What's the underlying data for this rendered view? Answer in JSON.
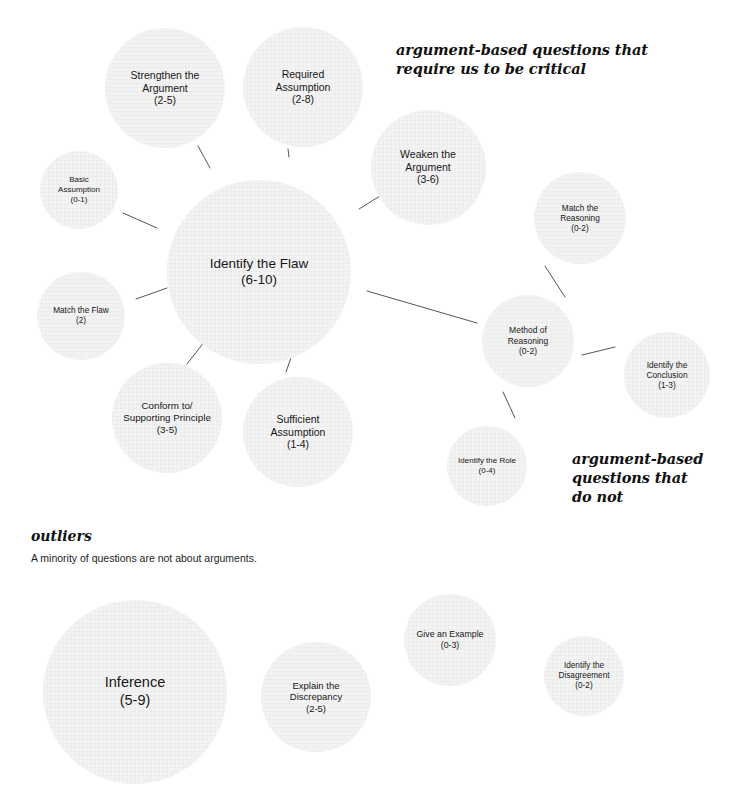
{
  "diagram": {
    "title_hidden": "",
    "colors": {
      "bubble_fill": "#f3f3f3",
      "text": "#171717",
      "line": "#555555",
      "background": "#ffffff"
    },
    "annotations": {
      "critical": "argument-based questions that\nrequire us to be critical",
      "do_not": "argument-based\nquestions that\ndo not"
    },
    "outliers": {
      "heading": "outliers",
      "subtitle": "A minority of questions are not about arguments."
    },
    "cluster_main": {
      "nodes": [
        {
          "id": "identify-the-flaw",
          "label": "Identify the Flaw",
          "count": "(6-10)",
          "cx": 259,
          "cy": 272,
          "r": 92,
          "font": 13.5
        },
        {
          "id": "strengthen-the-argument",
          "label": "Strengthen the\nArgument",
          "count": "(2-5)",
          "cx": 165,
          "cy": 88,
          "r": 60,
          "font": 10.5
        },
        {
          "id": "required-assumption",
          "label": "Required\nAssumption",
          "count": "(2-8)",
          "cx": 303,
          "cy": 87,
          "r": 60,
          "font": 10.5
        },
        {
          "id": "weaken-the-argument",
          "label": "Weaken the\nArgument",
          "count": "(3-6)",
          "cx": 428,
          "cy": 167,
          "r": 57.5,
          "font": 10.5
        },
        {
          "id": "basic-assumption",
          "label": "Basic\nAssumption",
          "count": "(0-1)",
          "cx": 79,
          "cy": 190,
          "r": 39,
          "font": 8.0
        },
        {
          "id": "match-the-flaw",
          "label": "Match the Flaw",
          "count": "(2)",
          "cx": 81,
          "cy": 316,
          "r": 44,
          "font": 8.2
        },
        {
          "id": "conform-supporting",
          "label": "Conform to/\nSupporting Principle",
          "count": "(3-5)",
          "cx": 167,
          "cy": 418,
          "r": 55,
          "font": 9.8
        },
        {
          "id": "sufficient-assumption",
          "label": "Sufficient\nAssumption",
          "count": "(1-4)",
          "cx": 298,
          "cy": 432,
          "r": 55,
          "font": 10.5
        },
        {
          "id": "match-the-reasoning",
          "label": "Match the\nReasoning",
          "count": "(0-2)",
          "cx": 580,
          "cy": 218,
          "r": 46,
          "font": 8.3
        },
        {
          "id": "method-of-reasoning",
          "label": "Method of\nReasoning",
          "count": "(0-2)",
          "cx": 528,
          "cy": 341,
          "r": 46,
          "font": 8.5
        },
        {
          "id": "identify-the-conclusion",
          "label": "Identify the\nConclusion",
          "count": "(1-3)",
          "cx": 667,
          "cy": 375,
          "r": 43,
          "font": 8.3
        },
        {
          "id": "identify-the-role",
          "label": "Identify the Role",
          "count": "(0-4)",
          "cx": 487,
          "cy": 466,
          "r": 40,
          "font": 8.0
        }
      ],
      "links": [
        {
          "from": "strengthen-the-argument",
          "to": "identify-the-flaw",
          "x1": 198,
          "y1": 146,
          "x2": 210,
          "y2": 168
        },
        {
          "from": "required-assumption",
          "to": "identify-the-flaw",
          "x1": 288,
          "y1": 149,
          "x2": 289,
          "y2": 157
        },
        {
          "from": "weaken-the-argument",
          "to": "identify-the-flaw",
          "x1": 359,
          "y1": 209,
          "x2": 380,
          "y2": 196
        },
        {
          "from": "basic-assumption",
          "to": "identify-the-flaw",
          "x1": 123,
          "y1": 213,
          "x2": 157,
          "y2": 228
        },
        {
          "from": "match-the-flaw",
          "to": "identify-the-flaw",
          "x1": 136,
          "y1": 299,
          "x2": 167,
          "y2": 288
        },
        {
          "from": "conform-supporting",
          "to": "identify-the-flaw",
          "x1": 187,
          "y1": 364,
          "x2": 205,
          "y2": 341
        },
        {
          "from": "sufficient-assumption",
          "to": "identify-the-flaw",
          "x1": 286,
          "y1": 372,
          "x2": 294,
          "y2": 349
        },
        {
          "from": "identify-the-flaw",
          "to": "method-of-reasoning",
          "x1": 367,
          "y1": 291,
          "x2": 477,
          "y2": 323
        },
        {
          "from": "match-the-reasoning",
          "to": "method-of-reasoning",
          "x1": 545,
          "y1": 266,
          "x2": 565,
          "y2": 297
        },
        {
          "from": "method-of-reasoning",
          "to": "identify-the-conclusion",
          "x1": 582,
          "y1": 355,
          "x2": 615,
          "y2": 347
        },
        {
          "from": "method-of-reasoning",
          "to": "identify-the-role",
          "x1": 503,
          "y1": 392,
          "x2": 515,
          "y2": 418
        }
      ]
    },
    "cluster_outliers": {
      "nodes": [
        {
          "id": "inference",
          "label": "Inference",
          "count": "(5-9)",
          "cx": 135,
          "cy": 692,
          "r": 92,
          "font": 14.5
        },
        {
          "id": "explain-the-discrepancy",
          "label": "Explain the\nDiscrepancy",
          "count": "(2-5)",
          "cx": 316,
          "cy": 697,
          "r": 55,
          "font": 9.5
        },
        {
          "id": "give-an-example",
          "label": "Give an Example",
          "count": "(0-3)",
          "cx": 450,
          "cy": 640,
          "r": 46,
          "font": 8.8
        },
        {
          "id": "identify-the-disagreement",
          "label": "Identify the\nDisagreement",
          "count": "(0-2)",
          "cx": 584,
          "cy": 676,
          "r": 40,
          "font": 8.2
        }
      ]
    }
  }
}
